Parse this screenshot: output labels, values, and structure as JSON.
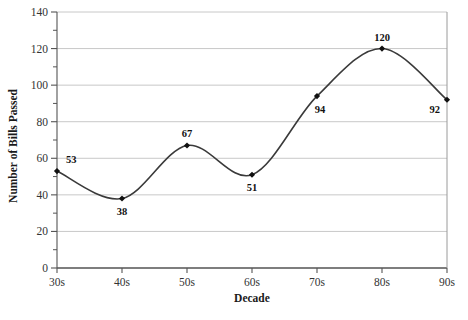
{
  "chart_data": {
    "type": "line",
    "title": "",
    "xlabel": "Decade",
    "ylabel": "Number of Bills Passed",
    "categories": [
      "30s",
      "40s",
      "50s",
      "60s",
      "70s",
      "80s",
      "90s"
    ],
    "values": [
      53,
      38,
      67,
      51,
      94,
      120,
      92
    ],
    "point_labels": [
      "53",
      "38",
      "67",
      "51",
      "94",
      "120",
      "92"
    ],
    "ylim": [
      0,
      140
    ],
    "ytick_labels": [
      "0",
      "20",
      "40",
      "60",
      "80",
      "100",
      "120",
      "140"
    ],
    "ytick_values": [
      0,
      20,
      40,
      60,
      80,
      100,
      120,
      140
    ],
    "yminor_step": 10,
    "grid": "horizontal",
    "legend": "none",
    "colors": {
      "line": "#3a3a3a",
      "marker": "#111111",
      "gridline": "#c8c8c8",
      "axis": "#555555",
      "background": "#ffffff",
      "text": "#1a1a1a"
    }
  }
}
